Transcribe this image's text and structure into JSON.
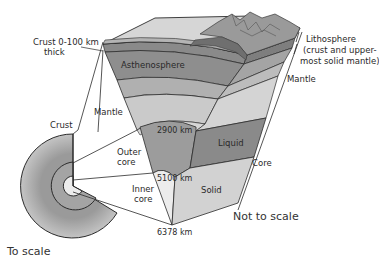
{
  "diagram": {
    "labels": {
      "crust_thickness_line1": "Crust 0-100 km",
      "crust_thickness_line2": "thick",
      "asthenosphere": "Asthenosphere",
      "lithosphere_line1": "Lithosphere",
      "lithosphere_line2": "(crust and upper-",
      "lithosphere_line3": "most solid mantle)",
      "mantle_right": "Mantle",
      "mantle_left": "Mantle",
      "crust_left": "Crust",
      "outer_core_line1": "Outer",
      "outer_core_line2": "core",
      "inner_core_line1": "Inner",
      "inner_core_line2": "core",
      "depth_2900": "2900 km",
      "depth_5100": "5100 km",
      "depth_6378": "6378 km",
      "liquid": "Liquid",
      "solid": "Solid",
      "core_right": "Core",
      "to_scale": "To scale",
      "not_to_scale": "Not to scale"
    },
    "colors": {
      "outline": "#2b2b2b",
      "crust_top": "#d4d4d4",
      "mountain": "#8c8c8c",
      "lithosphere": "#7a7a7a",
      "asthenosphere": "#8e8e8e",
      "mantle_upper": "#b0b0b0",
      "mantle_mid": "#c6c6c6",
      "mantle_lower": "#d8d8d8",
      "outer_core": "#999999",
      "inner_core": "#e6e6e6",
      "liquid_face": "#8a8a8a",
      "solid_face": "#d2d2d2",
      "scale_outer_ring": "#b8b8b8",
      "scale_inner_ring": "#a8a8a8",
      "scale_inner_core": "#ececec"
    }
  }
}
